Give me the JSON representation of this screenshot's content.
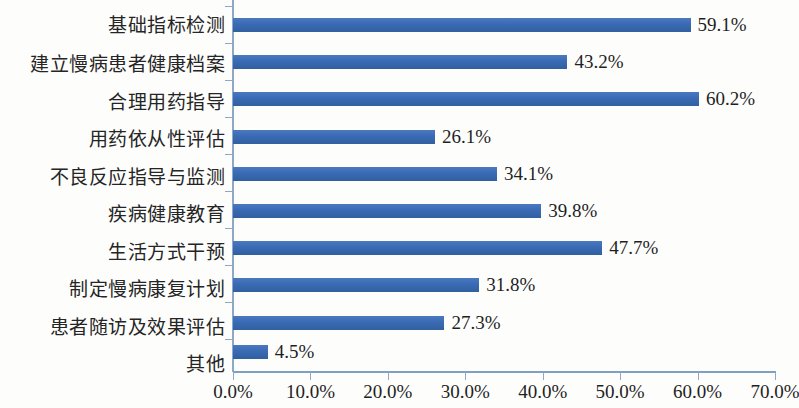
{
  "chart_data": {
    "type": "bar",
    "orientation": "horizontal",
    "title": "",
    "subtitle": "",
    "xlabel": "",
    "ylabel": "",
    "xlim": [
      0,
      70
    ],
    "xtick_labels": [
      "0.0%",
      "10.0%",
      "20.0%",
      "30.0%",
      "40.0%",
      "50.0%",
      "60.0%",
      "70.0%"
    ],
    "xticks": [
      0,
      10,
      20,
      30,
      40,
      50,
      60,
      70
    ],
    "grid": false,
    "legend": null,
    "bar_color": "#3b6cb5",
    "axis_color": "#8fa8c6",
    "text_color": "#1f1f1f",
    "categories": [
      "基础指标检测",
      "建立慢病患者健康档案",
      "合理用药指导",
      "用药依从性评估",
      "不良反应指导与监测",
      "疾病健康教育",
      "生活方式干预",
      "制定慢病康复计划",
      "患者随访及效果评估",
      "其他"
    ],
    "values": [
      59.1,
      43.2,
      60.2,
      26.1,
      34.1,
      39.8,
      47.7,
      31.8,
      27.3,
      4.5
    ],
    "data_labels": [
      "59.1%",
      "43.2%",
      "60.2%",
      "26.1%",
      "34.1%",
      "39.8%",
      "47.7%",
      "31.8%",
      "27.3%",
      "4.5%"
    ]
  }
}
